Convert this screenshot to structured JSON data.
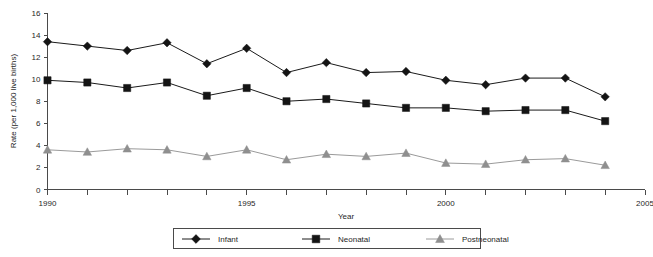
{
  "chart_data": {
    "type": "line",
    "title": "",
    "xlabel": "Year",
    "ylabel": "Rate (per 1,000 live births)",
    "x": [
      1990,
      1991,
      1992,
      1993,
      1994,
      1995,
      1996,
      1997,
      1998,
      1999,
      2000,
      2001,
      2002,
      2003,
      2004
    ],
    "xlim": [
      1990,
      2005
    ],
    "ylim": [
      0,
      16
    ],
    "xticks": [
      1990,
      1991,
      1992,
      1993,
      1994,
      1995,
      1996,
      1997,
      1998,
      1999,
      2000,
      2001,
      2002,
      2003,
      2004,
      2005
    ],
    "xtick_labels": [
      "1990",
      "",
      "",
      "",
      "",
      "1995",
      "",
      "",
      "",
      "",
      "2000",
      "",
      "",
      "",
      "",
      "2005"
    ],
    "yticks": [
      0,
      2,
      4,
      6,
      8,
      10,
      12,
      14,
      16
    ],
    "ytick_labels": [
      "0",
      "2",
      "4",
      "6",
      "8",
      "10",
      "12",
      "14",
      "16"
    ],
    "grid": false,
    "legend_position": "bottom",
    "series": [
      {
        "name": "Infant",
        "marker": "diamond",
        "color": "#141414",
        "values": [
          13.4,
          13.0,
          12.6,
          13.3,
          11.4,
          12.8,
          10.6,
          11.5,
          10.6,
          10.7,
          9.9,
          9.5,
          10.1,
          10.1,
          8.4
        ]
      },
      {
        "name": "Neonatal",
        "marker": "square",
        "color": "#141414",
        "values": [
          9.9,
          9.7,
          9.2,
          9.7,
          8.5,
          9.2,
          8.0,
          8.2,
          7.8,
          7.4,
          7.4,
          7.1,
          7.2,
          7.2,
          6.2
        ]
      },
      {
        "name": "Postneonatal",
        "marker": "triangle",
        "color": "#8f8f8f",
        "values": [
          3.6,
          3.4,
          3.7,
          3.6,
          3.0,
          3.6,
          2.7,
          3.2,
          3.0,
          3.3,
          2.4,
          2.3,
          2.7,
          2.8,
          2.2
        ]
      }
    ]
  },
  "axes": {
    "y_title": "Rate (per 1,000 live births)",
    "x_title": "Year"
  },
  "legend": {
    "entries": [
      {
        "label": "Infant",
        "marker": "diamond-icon"
      },
      {
        "label": "Neonatal",
        "marker": "square-icon"
      },
      {
        "label": "Postneonatal",
        "marker": "triangle-icon"
      }
    ]
  },
  "colors": {
    "dark_series": "#141414",
    "gray_series": "#8f8f8f",
    "axis": "#4a4a4a",
    "text": "#1f1f1f",
    "background": "#ffffff"
  }
}
